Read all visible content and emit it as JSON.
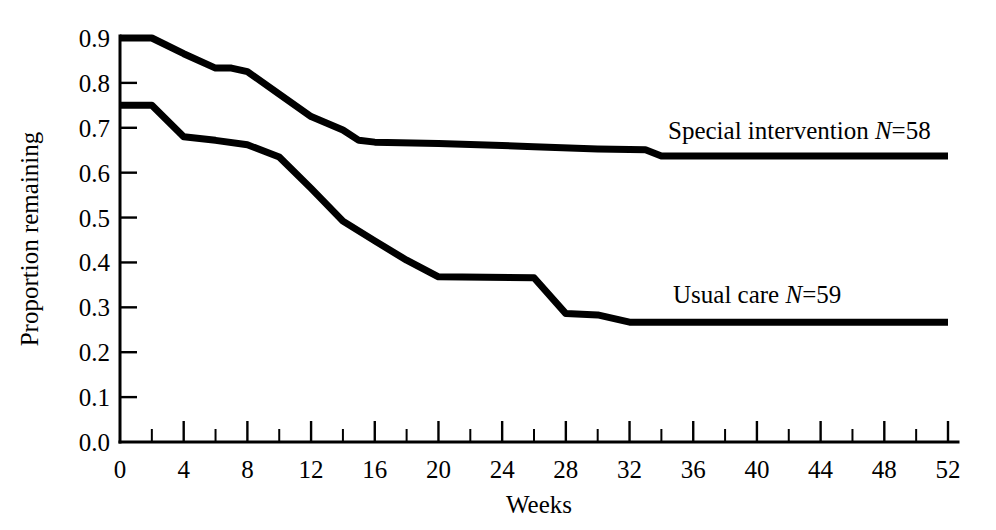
{
  "chart_data": {
    "type": "line",
    "title": "",
    "subtitle": "",
    "xlabel": "Weeks",
    "ylabel": "Proportion remaining",
    "xlim": [
      0,
      52
    ],
    "ylim": [
      0.0,
      0.9
    ],
    "grid": false,
    "legend_position": "inline-right-of-curves",
    "x_ticks": [
      0,
      4,
      8,
      12,
      16,
      20,
      24,
      28,
      32,
      36,
      40,
      44,
      48,
      52
    ],
    "x_tick_labels": [
      "0",
      "4",
      "8",
      "12",
      "16",
      "20",
      "24",
      "28",
      "32",
      "36",
      "40",
      "44",
      "48",
      "52"
    ],
    "x_minor_tick_step": 2,
    "y_ticks": [
      0.0,
      0.1,
      0.2,
      0.3,
      0.4,
      0.5,
      0.6,
      0.7,
      0.8,
      0.9
    ],
    "y_tick_labels": [
      "0.0",
      "0.1",
      "0.2",
      "0.3",
      "0.4",
      "0.5",
      "0.6",
      "0.7",
      "0.8",
      "0.9"
    ],
    "series": [
      {
        "name": "Special intervention",
        "label_text": "Special intervention ",
        "label_italic": "N",
        "label_tail": "=58",
        "n": 58,
        "color": "#000000",
        "x": [
          0,
          2,
          4,
          6,
          7,
          8,
          10,
          12,
          14,
          15,
          16,
          20,
          22,
          26,
          30,
          33,
          34,
          52
        ],
        "values": [
          0.9,
          0.9,
          0.865,
          0.833,
          0.833,
          0.825,
          0.775,
          0.725,
          0.695,
          0.672,
          0.668,
          0.665,
          0.663,
          0.658,
          0.653,
          0.651,
          0.637,
          0.637
        ]
      },
      {
        "name": "Usual care",
        "label_text": "Usual care ",
        "label_italic": "N",
        "label_tail": "=59",
        "n": 59,
        "color": "#000000",
        "x": [
          0,
          2,
          4,
          6,
          8,
          10,
          12,
          14,
          16,
          18,
          20,
          26,
          28,
          30,
          32,
          52
        ],
        "values": [
          0.75,
          0.75,
          0.68,
          0.672,
          0.662,
          0.635,
          0.565,
          0.492,
          0.448,
          0.405,
          0.368,
          0.366,
          0.286,
          0.283,
          0.267,
          0.267
        ]
      }
    ],
    "annotations": [
      {
        "name": "special-intervention-label",
        "text": "Special intervention N=58",
        "x_week": 34.5,
        "y_value": 0.672
      },
      {
        "name": "usual-care-label",
        "text": "Usual care N=59",
        "x_week": 35.0,
        "y_value": 0.305
      }
    ]
  }
}
